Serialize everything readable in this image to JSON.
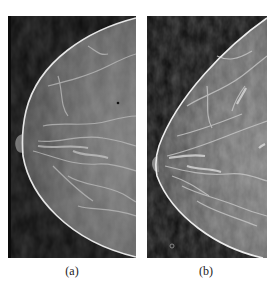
{
  "figure": {
    "top_caption_fragment": "",
    "panels": [
      {
        "id": "a",
        "label": "(a)",
        "content": "mammogram-craniocaudal-view",
        "background_color": "#0c0c0c",
        "tissue_color": "#6e6e6e",
        "skin_line_color": "#e6e6e6"
      },
      {
        "id": "b",
        "label": "(b)",
        "content": "mammogram-craniocaudal-view-enhanced",
        "background_color": "#0c0c0c",
        "tissue_color": "#707070",
        "skin_line_color": "#ededed",
        "marker": "small-circle-marker"
      }
    ]
  }
}
